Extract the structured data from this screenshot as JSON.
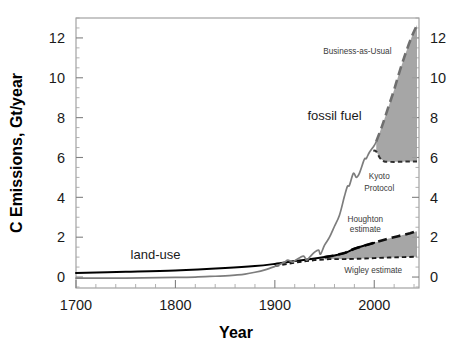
{
  "chart_data": {
    "type": "line",
    "title": "",
    "xlabel": "Year",
    "ylabel": "C Emissions, Gt/year",
    "xlim": [
      1700,
      2045
    ],
    "ylim": [
      -0.55,
      13.0
    ],
    "grid": false,
    "legend_position": "inline-annotations",
    "x_ticks": [
      1700,
      1800,
      1900,
      2000
    ],
    "x_tick_labels": [
      "1700",
      "1800",
      "1900",
      "2000"
    ],
    "x_minor_step": 20,
    "y_ticks": [
      0,
      2,
      4,
      6,
      8,
      10,
      12
    ],
    "y_tick_labels": [
      "0",
      "2",
      "4",
      "6",
      "8",
      "10",
      "12"
    ],
    "y_tick_labels_right": [
      "0",
      "2",
      "4",
      "6",
      "8",
      "10",
      "12"
    ],
    "y_minor_step": 0.5,
    "annotations": [
      {
        "name": "fossil-fuel",
        "text": "fossil fuel",
        "x": 1960,
        "y": 7.9,
        "size": "large"
      },
      {
        "name": "business-as-usual",
        "text": "Business-as-Usual",
        "x": 1983,
        "y": 11.2,
        "size": "small"
      },
      {
        "name": "kyoto-protocol-line1",
        "text": "Kyoto",
        "x": 2005,
        "y": 4.9,
        "size": "small"
      },
      {
        "name": "kyoto-protocol-line2",
        "text": "Protocol",
        "x": 2005,
        "y": 4.3,
        "size": "small"
      },
      {
        "name": "houghton-estimate-line1",
        "text": "Houghton",
        "x": 1991,
        "y": 2.75,
        "size": "small"
      },
      {
        "name": "houghton-estimate-line2",
        "text": "estimate",
        "x": 1991,
        "y": 2.28,
        "size": "small"
      },
      {
        "name": "wigley-estimate",
        "text": "Wigley estimate",
        "x": 1999,
        "y": 0.22,
        "size": "small"
      },
      {
        "name": "land-use",
        "text": "land-use",
        "x": 1780,
        "y": 0.92,
        "size": "large"
      }
    ],
    "series": [
      {
        "name": "fossil fuel",
        "style": "solid",
        "color": "#7d7d7d",
        "x": [
          1700,
          1750,
          1800,
          1820,
          1840,
          1850,
          1860,
          1870,
          1880,
          1890,
          1900,
          1905,
          1910,
          1913,
          1918,
          1920,
          1925,
          1929,
          1932,
          1935,
          1940,
          1944,
          1946,
          1950,
          1955,
          1960,
          1965,
          1970,
          1973,
          1975,
          1979,
          1982,
          1985,
          1990,
          1992,
          1995,
          2000,
          2002
        ],
        "y": [
          -0.05,
          -0.05,
          -0.02,
          0.0,
          0.04,
          0.06,
          0.1,
          0.15,
          0.24,
          0.36,
          0.53,
          0.63,
          0.75,
          0.85,
          0.75,
          0.82,
          0.97,
          1.05,
          0.85,
          1.0,
          1.25,
          1.35,
          1.15,
          1.6,
          2.0,
          2.55,
          3.1,
          4.05,
          4.55,
          4.6,
          5.2,
          5.0,
          5.2,
          5.9,
          5.95,
          6.25,
          6.6,
          6.8
        ]
      },
      {
        "name": "land-use",
        "style": "solid",
        "color": "#000000",
        "x": [
          1700,
          1750,
          1800,
          1850,
          1880,
          1900,
          1920,
          1940,
          1950,
          1960,
          1970,
          1980,
          1990,
          2000
        ],
        "y": [
          0.2,
          0.26,
          0.33,
          0.45,
          0.55,
          0.66,
          0.8,
          0.93,
          1.0,
          1.08,
          1.2,
          1.42,
          1.58,
          1.72
        ]
      },
      {
        "name": "Business-as-Usual",
        "style": "long-dash",
        "color": "#6f6f6f",
        "x": [
          2002,
          2008,
          2014,
          2020,
          2026,
          2032,
          2038,
          2043
        ],
        "y": [
          6.8,
          7.6,
          8.5,
          9.4,
          10.4,
          11.3,
          12.1,
          12.65
        ]
      },
      {
        "name": "Kyoto Protocol",
        "style": "short-dash",
        "color": "#303030",
        "x": [
          1999,
          2002,
          2006,
          2010,
          2016,
          2024,
          2034,
          2043
        ],
        "y": [
          6.35,
          6.3,
          5.95,
          5.8,
          5.78,
          5.78,
          5.8,
          5.8
        ]
      },
      {
        "name": "Houghton estimate",
        "style": "long-dash",
        "color": "#111111",
        "x": [
          1950,
          1960,
          1970,
          1980,
          1990,
          2000,
          2012,
          2024,
          2036,
          2043
        ],
        "y": [
          1.0,
          1.08,
          1.2,
          1.42,
          1.58,
          1.72,
          1.9,
          2.05,
          2.2,
          2.3
        ]
      },
      {
        "name": "Wigley estimate",
        "style": "short-dash",
        "color": "#1a1a1a",
        "x": [
          1900,
          1920,
          1940,
          1955,
          1970,
          1985,
          2000,
          2015,
          2030,
          2043
        ],
        "y": [
          0.55,
          0.72,
          0.85,
          0.9,
          0.9,
          0.92,
          0.95,
          0.98,
          1.0,
          1.02
        ]
      }
    ],
    "shaded_regions": [
      {
        "name": "bau-kyoto-gap",
        "between": [
          "Business-as-Usual",
          "Kyoto Protocol"
        ],
        "color": "#9e9e9e"
      },
      {
        "name": "houghton-wigley-gap",
        "between": [
          "Houghton estimate",
          "Wigley estimate"
        ],
        "color": "#9e9e9e"
      }
    ]
  }
}
